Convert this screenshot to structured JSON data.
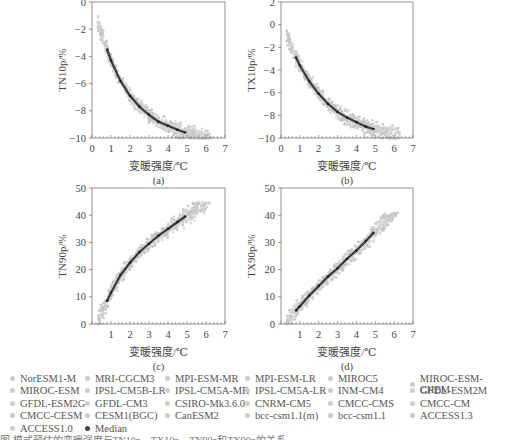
{
  "figure": {
    "xlabel": "变暖强度/℃",
    "panels": [
      {
        "id": "a",
        "label": "(a)",
        "ylabel": "TN10p/%"
      },
      {
        "id": "b",
        "label": "(b)",
        "ylabel": "TX10p/%"
      },
      {
        "id": "c",
        "label": "(c)",
        "ylabel": "TN90p/%"
      },
      {
        "id": "d",
        "label": "(d)",
        "ylabel": "TX90p/%"
      }
    ]
  },
  "legend": {
    "items": [
      "NorESM1-M",
      "MRI-CGCM3",
      "MPI-ESM-MR",
      "MPI-ESM-LR",
      "MIROC5",
      "MIROC-ESM-CHEM",
      "MIROC-ESM",
      "IPSL-CM5B-LR",
      "IPSL-CM5A-MR",
      "IPSL-CM5A-LR",
      "INM-CM4",
      "GFDL-ESM2M",
      "GFDL-ESM2G",
      "GFDL-CM3",
      "CSIRO-Mk3.6.0",
      "CNRM-CM5",
      "CMCC-CMS",
      "CMCC-CM",
      "CMCC-CESM",
      "CESM1(BGC)",
      "CanESM2",
      "bcc-csm1.1(m)",
      "bcc-csm1.1",
      "ACCESS1.3",
      "ACCESS1.0",
      "Median"
    ]
  },
  "caption": "图          模式预估的变暖强度与TN10p、TX10p、TN90p和TX90p的关系",
  "colors": {
    "scatter": "#c8c8c8",
    "median": "#3a3a3a",
    "axis": "#555555"
  },
  "chart_data": [
    {
      "type": "scatter",
      "title": "(a)",
      "xlabel": "变暖强度/℃",
      "ylabel": "TN10p/%",
      "xlim": [
        0,
        7
      ],
      "ylim": [
        -10,
        0
      ],
      "xticks": [
        0,
        1,
        2,
        3,
        4,
        5,
        6,
        7
      ],
      "yticks": [
        -10,
        -8,
        -6,
        -4,
        -2,
        0
      ],
      "series": [
        {
          "name": "Median",
          "x": [
            0.8,
            1.0,
            1.5,
            2.0,
            2.5,
            3.0,
            3.5,
            4.0,
            4.5,
            4.9
          ],
          "y": [
            -3.5,
            -4.3,
            -5.8,
            -6.9,
            -7.7,
            -8.3,
            -8.8,
            -9.1,
            -9.4,
            -9.6
          ]
        },
        {
          "name": "Models (scatter)",
          "x_range": [
            0.3,
            6.3
          ],
          "y_range": [
            -10,
            -0.8
          ]
        }
      ]
    },
    {
      "type": "scatter",
      "title": "(b)",
      "xlabel": "变暖强度/℃",
      "ylabel": "TX10p/%",
      "xlim": [
        0,
        7
      ],
      "ylim": [
        -10,
        2
      ],
      "xticks": [
        0,
        1,
        2,
        3,
        4,
        5,
        6,
        7
      ],
      "yticks": [
        -10,
        -8,
        -6,
        -4,
        -2,
        0,
        2
      ],
      "series": [
        {
          "name": "Median",
          "x": [
            0.8,
            1.0,
            1.5,
            2.0,
            2.5,
            3.0,
            3.5,
            4.0,
            4.5,
            4.9
          ],
          "y": [
            -2.9,
            -3.6,
            -5.0,
            -6.1,
            -7.0,
            -7.7,
            -8.2,
            -8.6,
            -9.0,
            -9.2
          ]
        },
        {
          "name": "Models (scatter)",
          "x_range": [
            0.3,
            6.3
          ],
          "y_range": [
            -10,
            0.5
          ]
        }
      ]
    },
    {
      "type": "scatter",
      "title": "(c)",
      "xlabel": "变暖强度/℃",
      "ylabel": "TN90p/%",
      "xlim": [
        0,
        7
      ],
      "ylim": [
        0,
        50
      ],
      "xticks": [
        1,
        2,
        3,
        4,
        5,
        6,
        7
      ],
      "yticks": [
        0,
        10,
        20,
        30,
        40,
        50
      ],
      "series": [
        {
          "name": "Median",
          "x": [
            0.8,
            1.0,
            1.5,
            2.0,
            2.5,
            3.0,
            3.5,
            4.0,
            4.5,
            4.9
          ],
          "y": [
            8.5,
            11.5,
            18,
            22.5,
            26.5,
            29.5,
            32.5,
            35,
            37.5,
            39.5
          ]
        },
        {
          "name": "Models (scatter)",
          "x_range": [
            0.3,
            6.2
          ],
          "y_range": [
            0,
            45
          ]
        }
      ]
    },
    {
      "type": "scatter",
      "title": "(d)",
      "xlabel": "变暖强度/℃",
      "ylabel": "TX90p/%",
      "xlim": [
        0,
        7
      ],
      "ylim": [
        0,
        50
      ],
      "xticks": [
        1,
        2,
        3,
        4,
        5,
        6,
        7
      ],
      "yticks": [
        0,
        10,
        20,
        30,
        40,
        50
      ],
      "series": [
        {
          "name": "Median",
          "x": [
            0.8,
            1.0,
            1.5,
            2.0,
            2.5,
            3.0,
            3.5,
            4.0,
            4.5,
            4.9
          ],
          "y": [
            5,
            6.5,
            10.5,
            14,
            17.5,
            20.5,
            24,
            27,
            30.5,
            33.5
          ]
        },
        {
          "name": "Models (scatter)",
          "x_range": [
            0.3,
            6.2
          ],
          "y_range": [
            0,
            41
          ]
        }
      ]
    }
  ]
}
